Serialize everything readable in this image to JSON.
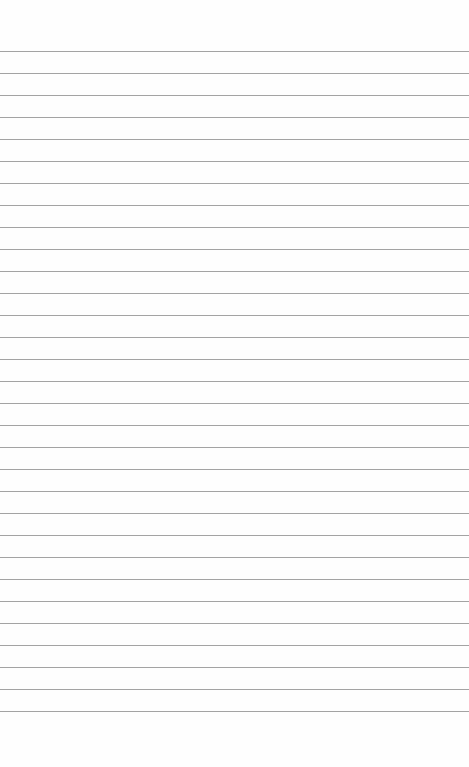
{
  "page": {
    "type": "blank lined paper",
    "background_color": "#fefefe",
    "line_color": "#a3a3a3",
    "first_line_y": 51,
    "line_spacing": 22,
    "line_count": 31
  }
}
